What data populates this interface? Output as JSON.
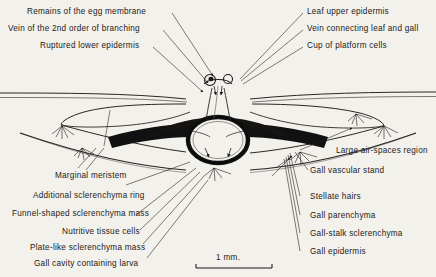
{
  "figure": {
    "title_visible": false,
    "background_color": "#f3f1ec",
    "ink_color": "#1c1a18"
  },
  "labels": {
    "top_left": [
      {
        "id": "egg-membrane",
        "text": "Remains of the egg membrane"
      },
      {
        "id": "vein-2nd-order",
        "text": "Vein of the 2nd order of branching"
      },
      {
        "id": "ruptured-epidermis",
        "text": "Ruptured lower epidermis"
      }
    ],
    "top_right": [
      {
        "id": "leaf-upper-epidermis",
        "text": "Leaf upper epidermis"
      },
      {
        "id": "vein-connecting",
        "text": "Vein connecting leaf and gall"
      },
      {
        "id": "cup-platform-cells",
        "text": "Cup of platform cells"
      }
    ],
    "bottom_left": [
      {
        "id": "marginal-meristem",
        "text": "Marginal meristem"
      },
      {
        "id": "additional-sclerenchyma-ring",
        "text": "Additional sclerenchyma ring"
      },
      {
        "id": "funnel-sclerenchyma",
        "text": "Funnel-shaped sclerenchyma mass"
      },
      {
        "id": "nutritive-tissue",
        "text": "Nutritive tissue cells"
      },
      {
        "id": "plate-sclerenchyma",
        "text": "Plate-like sclerenchyma mass"
      },
      {
        "id": "gall-cavity-larva",
        "text": "Gall cavity containing larva"
      }
    ],
    "bottom_right": [
      {
        "id": "air-spaces",
        "text": "Large air-spaces region"
      },
      {
        "id": "gall-vascular-stand",
        "text": "Gall vascular stand"
      },
      {
        "id": "stellate-hairs",
        "text": "Stellate hairs"
      },
      {
        "id": "gall-parenchyma",
        "text": "Gall parenchyma"
      },
      {
        "id": "gall-stalk-sclerenchyma",
        "text": "Gall-stalk sclerenchyma"
      },
      {
        "id": "gall-epidermis",
        "text": "Gall epidermis"
      }
    ]
  },
  "scale_bar": {
    "label": "1 mm."
  }
}
